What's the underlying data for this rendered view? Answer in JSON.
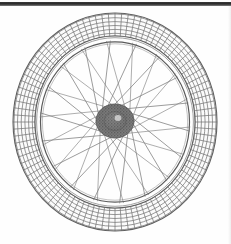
{
  "figure": {
    "title": "Bicycle Wheel",
    "style": "line-engraving",
    "medium": "scanned line art",
    "background_color": "#fefefe",
    "ink_color": "#5a5a5a",
    "scan_artifact": {
      "name": "scan-bar",
      "description": "dark horizontal scan edge bar across top of page",
      "color": "#2b2b2b",
      "x": 0,
      "y": 2,
      "width": 231,
      "height": 4
    },
    "geometry": {
      "center_x": 115,
      "center_y": 122,
      "tire_outer_radius_x": 102,
      "tire_outer_radius_y": 109,
      "tire_inner_radius_x": 80,
      "tire_inner_radius_y": 86,
      "rim_inner_radius_x": 74,
      "rim_inner_radius_y": 80,
      "hub_radius_x": 19,
      "hub_radius_y": 17,
      "hub_center_x": 115,
      "hub_center_y": 121
    },
    "parts": [
      {
        "name": "tire",
        "label": "Tire with cross-hatched tread",
        "tread_pattern": "grid",
        "tread_rows": 3,
        "tread_cells": 96,
        "color": "#6e6e6e"
      },
      {
        "name": "rim",
        "label": "Wheel rim",
        "color": "#707070"
      },
      {
        "name": "spokes",
        "label": "Tangential crossed spokes",
        "count": 36,
        "lacing": "cross-3",
        "color": "#777777"
      },
      {
        "name": "hub",
        "label": "Stippled hub",
        "texture": "stipple",
        "color": "#6a6a6a"
      }
    ],
    "crop": {
      "bottom_cropped": false,
      "note": "wheel fully inside frame"
    }
  }
}
